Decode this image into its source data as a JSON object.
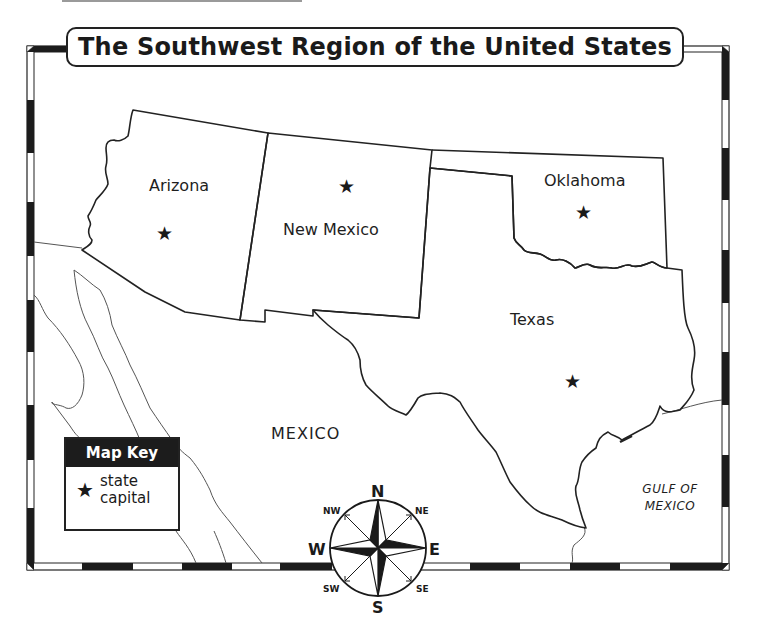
{
  "title": "The Southwest Region of the United States",
  "states": [
    {
      "name": "Arizona",
      "label_x": 149,
      "label_y": 176,
      "capital_x": 156,
      "capital_y": 224
    },
    {
      "name": "New Mexico",
      "label_x": 283,
      "label_y": 220,
      "capital_x": 338,
      "capital_y": 177
    },
    {
      "name": "Oklahoma",
      "label_x": 544,
      "label_y": 171,
      "capital_x": 575,
      "capital_y": 203
    },
    {
      "name": "Texas",
      "label_x": 510,
      "label_y": 310,
      "capital_x": 564,
      "capital_y": 372
    }
  ],
  "regions": {
    "mexico": "MEXICO",
    "gulf_line1": "GULF OF",
    "gulf_line2": "MEXICO"
  },
  "map_key": {
    "header": "Map Key",
    "symbol": "★",
    "symbol_name": "star-icon",
    "line1": "state",
    "line2": "capital"
  },
  "compass": {
    "N": "N",
    "S": "S",
    "E": "E",
    "W": "W",
    "NE": "NE",
    "NW": "NW",
    "SE": "SE",
    "SW": "SW"
  },
  "capital_symbol": "★",
  "colors": {
    "ink": "#1a1a1a",
    "border_black": "#1c1c1c",
    "border_white": "#ffffff",
    "coast_line": "#555555",
    "background": "#ffffff"
  }
}
